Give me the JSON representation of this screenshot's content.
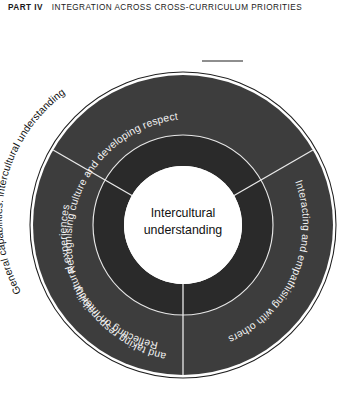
{
  "header": {
    "part": "PART IV",
    "title": "INTEGRATION ACROSS CROSS-CURRICULUM PRIORITIES"
  },
  "diagram": {
    "name": "intercultural-understanding-wheel",
    "outer_label": "General capabilities: intercultural understanding",
    "center_label_line1": "Intercultural",
    "center_label_line2": "understanding",
    "segments": [
      {
        "id": "recognising-culture",
        "label": "Recognising culture and developing respect"
      },
      {
        "id": "interacting-empathising",
        "label": "Interacting and empathising with others"
      },
      {
        "id": "reflecting-responsibility",
        "label_line1": "Reflecting on intercultural experiences",
        "label_line2": "and taking responsibility"
      }
    ],
    "colors": {
      "band_outer": "#3d3d3d",
      "band_inner": "#2a2a2a",
      "core": "#ffffff",
      "outline": "#1e1e1e",
      "separator": "#e8e8e8",
      "segment_text": "#f2f2f2",
      "label_text": "#111111",
      "page_background": "#ffffff"
    }
  }
}
